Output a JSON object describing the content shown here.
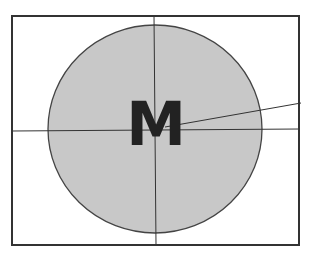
{
  "diagram": {
    "center_label": "M",
    "colors": {
      "background": "#ffffff",
      "circle_fill": "#c8c8c8",
      "stroke": "#333333",
      "label": "#222222"
    },
    "frame": {
      "x": 12,
      "y": 16,
      "width": 287,
      "height": 229
    },
    "circle": {
      "cx": 155,
      "cy": 129,
      "rx": 107,
      "ry": 104
    },
    "lines": {
      "horizontal": {
        "x1": 12,
        "y1": 131,
        "x2": 299,
        "y2": 129
      },
      "vertical": {
        "x1": 154,
        "y1": 16,
        "x2": 156,
        "y2": 245
      },
      "radial": {
        "x1": 168,
        "y1": 127,
        "x2": 301,
        "y2": 103
      }
    }
  }
}
